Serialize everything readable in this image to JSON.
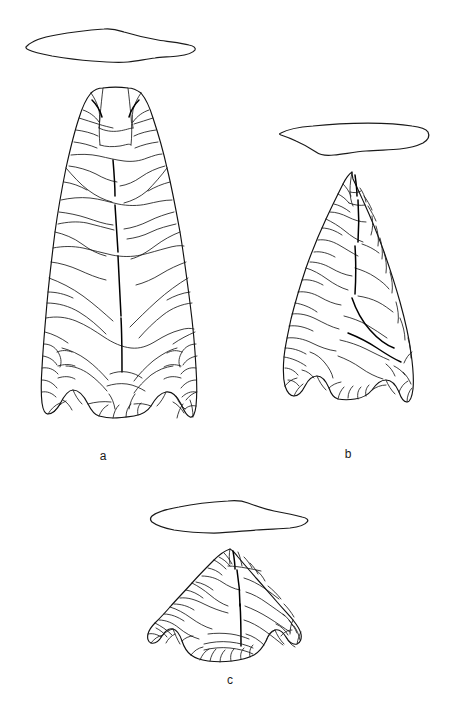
{
  "figure": {
    "type": "archaeological-line-drawing",
    "title": "",
    "background_color": "#ffffff",
    "line_color": "#1a1a1a",
    "width": 452,
    "height": 719,
    "specimens": [
      {
        "id": "a",
        "label": "a",
        "description": "Large lanceolate fluted projectile point, concave base with basal ears, shown in face view with flake scar pattern",
        "cross_section": "biconvex lenticular cross-section profile",
        "label_position": {
          "x": 103,
          "y": 456
        }
      },
      {
        "id": "b",
        "label": "b",
        "description": "Medium triangular projectile point with concave notched base, shown in face view with flake scar pattern",
        "cross_section": "plano-convex asymmetric cross-section profile",
        "label_position": {
          "x": 348,
          "y": 454
        }
      },
      {
        "id": "c",
        "label": "c",
        "description": "Small side-notched projectile point with expanding stem and concave base, shown in face view with flake scar pattern",
        "cross_section": "thin asymmetric lenticular cross-section profile",
        "label_position": {
          "x": 230,
          "y": 680
        }
      }
    ]
  }
}
